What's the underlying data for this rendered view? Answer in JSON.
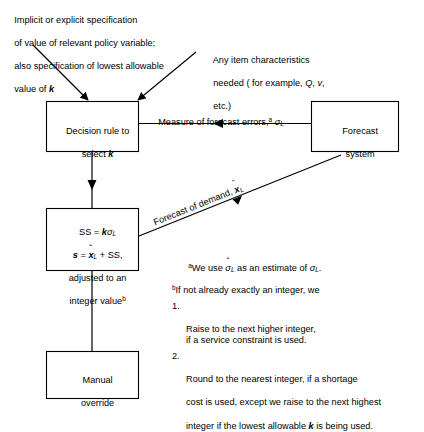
{
  "diagram": {
    "line_color": "#000000",
    "background": "#ffffff"
  },
  "annotations": {
    "top_left": "Implicit or explicit specification\nof value of relevant policy variable;\nalso specification of lowest allowable\nvalue of k",
    "top_left_lines": [
      "Implicit or explicit specification",
      "of value of relevant policy variable;",
      "also specification of lowest allowable",
      "value of "
    ],
    "top_left_italic_tail": "k",
    "top_right_lines": [
      "Any item characteristics",
      "needed ( for example, ",
      "etc.)"
    ],
    "top_right_vars": [
      "Q",
      "v"
    ],
    "top_right_full": "Any item characteristics needed ( for example, Q, v, etc.)"
  },
  "boxes": {
    "decision_rule": {
      "line1": "Decision rule to",
      "line2_prefix": "select ",
      "line2_var": "k"
    },
    "forecast_system": {
      "line1": "Forecast",
      "line2": "system"
    },
    "ss_box": {
      "line1_prefix": "SS = ",
      "line1_k": "k",
      "line1_sigma": "σ",
      "line1_sub": "L",
      "line2_s": "s",
      "line2_eq": " = ",
      "line2_xhat": "x",
      "line2_hat": "ˆ",
      "line2_sub": "L",
      "line2_tail": " + SS,",
      "line3": "adjusted to an",
      "line4": "integer value",
      "line4_sup": "b"
    },
    "manual_override": {
      "line1": "Manual",
      "line2": "override"
    }
  },
  "edge_labels": {
    "measure_prefix": "Measure of forecast errors,",
    "measure_sup": "a",
    "measure_sigma": "σ",
    "measure_sub": "L",
    "forecast_demand_prefix": "Forecast of demand, ",
    "forecast_demand_var": "x",
    "forecast_demand_hat": "ˆ",
    "forecast_demand_sub": "L"
  },
  "footnotes": {
    "a": {
      "marker": "a",
      "prefix": "We use ",
      "sigma_hat": "σ",
      "hat": "ˆ",
      "sub1": "L",
      "middle": " as an estimate of ",
      "sigma2": "σ",
      "sub2": "L",
      "suffix": ".",
      "full_text": "aWe use σ̂L as an estimate of σL."
    },
    "b": {
      "marker": "b",
      "intro": "If not already exactly an integer, we",
      "items": [
        {
          "num": "1.",
          "text": "Raise to the next higher integer,\nif a service constraint is used."
        },
        {
          "num": "2.",
          "text_part1": "Round to the nearest integer, if a shortage",
          "text_part2": "cost is used, except we raise to the next highest",
          "text_part3_pre": "integer if the lowest allowable ",
          "text_part3_var": "k",
          "text_part3_post": " is being used."
        }
      ]
    }
  }
}
